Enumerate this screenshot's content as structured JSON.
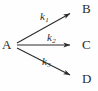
{
  "figure": {
    "kind": "reaction-scheme",
    "background_color": "#fefefe",
    "stroke_color": "#2b2b2b"
  },
  "nodes": [
    {
      "id": "A",
      "label": "A",
      "role": "reactant",
      "x": 16,
      "y": 45
    },
    {
      "id": "B",
      "label": "B",
      "role": "product",
      "x": 85,
      "y": 9
    },
    {
      "id": "C",
      "label": "C",
      "role": "product",
      "x": 85,
      "y": 45
    },
    {
      "id": "D",
      "label": "D",
      "role": "product",
      "x": 85,
      "y": 79
    }
  ],
  "arrows": [
    {
      "id": "arrow-k1",
      "from": "A",
      "to": "B",
      "rate_label": "k",
      "rate_subscript": "1",
      "x1": 17,
      "y1": 43,
      "x2": 72,
      "y2": 13
    },
    {
      "id": "arrow-k2",
      "from": "A",
      "to": "C",
      "rate_label": "k",
      "rate_subscript": "2",
      "x1": 17,
      "y1": 45,
      "x2": 72,
      "y2": 45
    },
    {
      "id": "arrow-k3",
      "from": "A",
      "to": "D",
      "rate_label": "k",
      "rate_subscript": "3",
      "x1": 17,
      "y1": 48,
      "x2": 72,
      "y2": 76
    }
  ],
  "labels": {
    "k1_base": "k",
    "k1_sub": "1",
    "k2_base": "k",
    "k2_sub": "2",
    "k3_base": "k",
    "k3_sub": "3"
  }
}
